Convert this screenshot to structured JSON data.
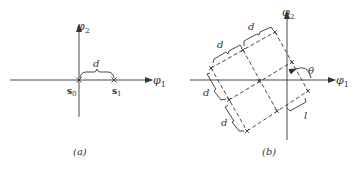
{
  "panel_a": {
    "axis_x_label": "φ",
    "axis_x_sub": "1",
    "axis_y_label": "φ",
    "axis_y_sub": "2",
    "point_0_label": "s",
    "point_0_sub": "0",
    "point_1_label": "s",
    "point_1_sub": "1",
    "distance_label": "d",
    "caption": "(a)"
  },
  "panel_b": {
    "axis_x_label": "φ",
    "axis_x_sub": "1",
    "axis_y_label": "φ",
    "axis_y_sub": "2",
    "distance_labels": [
      "d",
      "d",
      "d",
      "d"
    ],
    "angle_label": "θ",
    "offset_label": "l",
    "caption": "(b)"
  },
  "colors": {
    "ink": "#333333",
    "background": "#ffffff"
  }
}
